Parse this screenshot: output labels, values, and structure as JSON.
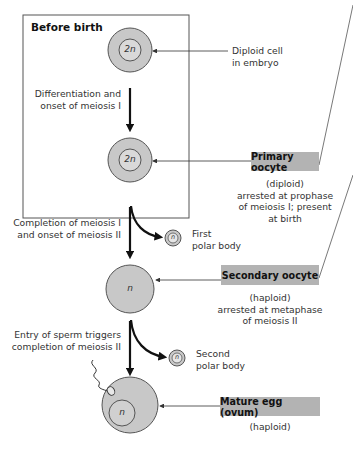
{
  "box": {
    "title": "Before birth"
  },
  "cells": {
    "embryo_cell": {
      "label": "2n",
      "note_line1": "Diploid cell",
      "note_line2": "in embryo"
    },
    "primary": {
      "label": "2n"
    },
    "secondary": {
      "label": "n"
    },
    "egg": {
      "label": "n"
    },
    "polar1": {
      "label": "n"
    },
    "polar2": {
      "label": "n"
    }
  },
  "steps": {
    "step1_line1": "Differentiation and",
    "step1_line2": "onset of meiosis I",
    "step2_line1": "Completion of meiosis I",
    "step2_line2": "and onset of meiosis II",
    "step3_line1": "Entry of sperm triggers",
    "step3_line2": "completion of meiosis II"
  },
  "polar_bodies": {
    "first_line1": "First",
    "first_line2": "polar body",
    "second_line1": "Second",
    "second_line2": "polar body"
  },
  "stages": {
    "primary": {
      "name": "Primary oocyte",
      "desc_line1": "(diploid)",
      "desc_line2": "arrested at prophase",
      "desc_line3": "of meiosis I; present",
      "desc_line4": "at birth"
    },
    "secondary": {
      "name": "Secondary oocyte",
      "desc_line1": "(haploid)",
      "desc_line2": "arrested at metaphase",
      "desc_line3": "of meiosis II"
    },
    "egg": {
      "name": "Mature egg (ovum)",
      "desc_line1": "(haploid)"
    }
  },
  "colors": {
    "cell_fill": "#c8c8c8",
    "tag_fill": "#b3b3b3",
    "line": "#333333"
  }
}
